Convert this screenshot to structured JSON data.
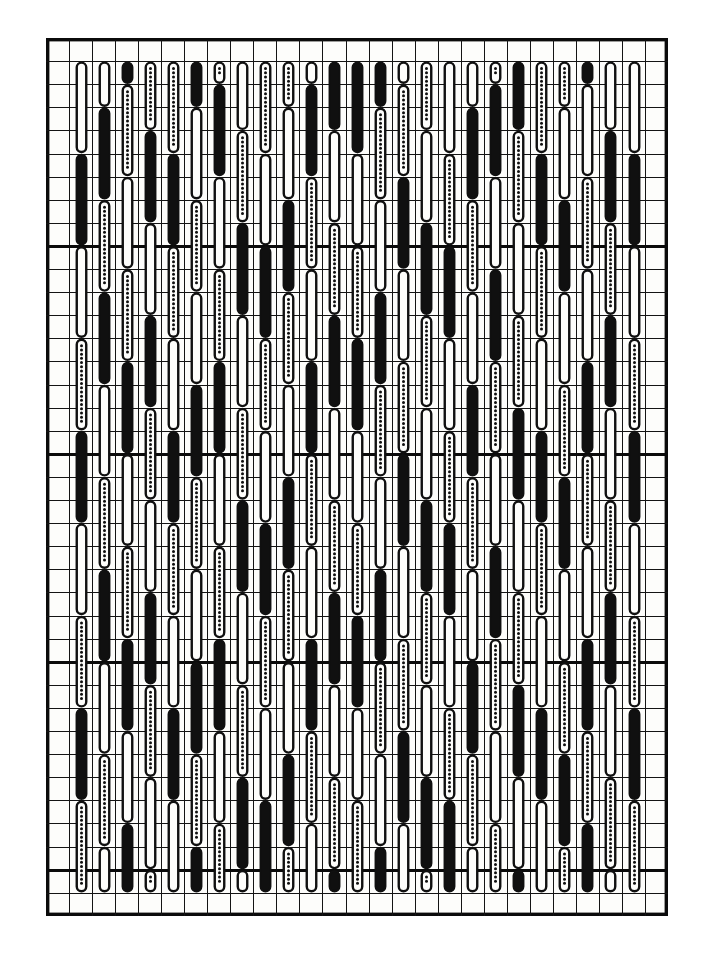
{
  "page": {
    "width": 704,
    "height": 962,
    "background_color": "#ffffff",
    "title": "Stitch pattern grid diagram"
  },
  "figure": {
    "x": 46,
    "y": 38,
    "width": 622,
    "height": 878,
    "paper_color": "#fdfdfb",
    "ink_color": "#101010"
  },
  "grid": {
    "columns": 27,
    "rows": 38,
    "cell_width": 23.04,
    "cell_height": 23.1,
    "minor_line_color": "#141414",
    "minor_line_width": 1.6,
    "major_line_color": "#0b0b0b",
    "major_line_width": 3.2,
    "major_row_interval": 9,
    "major_column_interval": 27,
    "frame_line_width": 3.4,
    "frame_color": "#0b0b0b"
  },
  "legend": {
    "fill_styles": [
      "solid",
      "dotted",
      "hollow"
    ],
    "solid_label": "solid filled stitch",
    "dotted_label": "beaded / dotted stitch",
    "hollow_label": "open outline stitch",
    "motif_label": "vertical capsule stitch mark"
  },
  "motif": {
    "shape": "capsule",
    "span_rows": 4,
    "stroke_width": 2.4,
    "capsule_width": 9.5,
    "dot_radius": 1.5,
    "dot_spacing": 4.2,
    "margin_columns_left": 1,
    "margin_columns_right": 1,
    "margin_rows_top": 1,
    "margin_rows_bottom": 1
  },
  "chart_data": {
    "type": "heatmap",
    "title": "Stitch pattern grid diagram",
    "xlabel": "",
    "ylabel": "",
    "columns": 27,
    "rows": 38,
    "legend": [
      "solid",
      "dotted",
      "hollow"
    ],
    "column_patterns": [
      {
        "column": 1,
        "offset": 0,
        "fills": [
          "dotted",
          "hollow",
          "solid",
          "hollow",
          "dotted",
          "solid",
          "hollow",
          "dotted",
          "solid"
        ]
      },
      {
        "column": 2,
        "offset": 2,
        "fills": [
          "hollow",
          "solid",
          "dotted",
          "solid",
          "hollow",
          "dotted",
          "solid",
          "hollow",
          "dotted"
        ]
      },
      {
        "column": 3,
        "offset": 1,
        "fills": [
          "solid",
          "dotted",
          "hollow",
          "dotted",
          "solid",
          "hollow",
          "dotted",
          "solid",
          "hollow"
        ]
      },
      {
        "column": 4,
        "offset": 3,
        "fills": [
          "dotted",
          "solid",
          "hollow",
          "solid",
          "dotted",
          "hollow",
          "solid",
          "dotted",
          "hollow"
        ]
      },
      {
        "column": 5,
        "offset": 0,
        "fills": [
          "hollow",
          "dotted",
          "solid",
          "dotted",
          "hollow",
          "solid",
          "dotted",
          "hollow",
          "solid"
        ]
      },
      {
        "column": 6,
        "offset": 2,
        "fills": [
          "solid",
          "hollow",
          "dotted",
          "hollow",
          "solid",
          "dotted",
          "hollow",
          "solid",
          "dotted"
        ]
      },
      {
        "column": 7,
        "offset": 1,
        "fills": [
          "dotted",
          "solid",
          "hollow",
          "dotted",
          "solid",
          "hollow",
          "dotted",
          "solid",
          "hollow"
        ]
      },
      {
        "column": 8,
        "offset": 3,
        "fills": [
          "hollow",
          "dotted",
          "solid",
          "hollow",
          "dotted",
          "solid",
          "hollow",
          "dotted",
          "solid"
        ]
      },
      {
        "column": 9,
        "offset": 0,
        "fills": [
          "solid",
          "dotted",
          "hollow",
          "solid",
          "dotted",
          "hollow",
          "solid",
          "dotted",
          "hollow"
        ]
      },
      {
        "column": 10,
        "offset": 2,
        "fills": [
          "dotted",
          "hollow",
          "solid",
          "dotted",
          "hollow",
          "solid",
          "dotted",
          "hollow",
          "solid"
        ]
      },
      {
        "column": 11,
        "offset": 1,
        "fills": [
          "hollow",
          "solid",
          "dotted",
          "hollow",
          "solid",
          "dotted",
          "hollow",
          "solid",
          "dotted"
        ]
      },
      {
        "column": 12,
        "offset": 3,
        "fills": [
          "solid",
          "hollow",
          "dotted",
          "solid",
          "hollow",
          "dotted",
          "solid",
          "hollow",
          "dotted"
        ]
      },
      {
        "column": 13,
        "offset": 0,
        "fills": [
          "dotted",
          "solid",
          "hollow",
          "dotted",
          "solid",
          "hollow",
          "dotted",
          "solid",
          "hollow"
        ]
      },
      {
        "column": 14,
        "offset": 2,
        "fills": [
          "solid",
          "dotted",
          "hollow",
          "solid",
          "dotted",
          "hollow",
          "solid",
          "dotted",
          "hollow"
        ]
      },
      {
        "column": 15,
        "offset": 1,
        "fills": [
          "hollow",
          "dotted",
          "solid",
          "hollow",
          "dotted",
          "solid",
          "hollow",
          "dotted",
          "solid"
        ]
      },
      {
        "column": 16,
        "offset": 3,
        "fills": [
          "dotted",
          "hollow",
          "solid",
          "dotted",
          "hollow",
          "solid",
          "dotted",
          "hollow",
          "solid"
        ]
      },
      {
        "column": 17,
        "offset": 0,
        "fills": [
          "solid",
          "hollow",
          "dotted",
          "solid",
          "hollow",
          "dotted",
          "solid",
          "hollow",
          "dotted"
        ]
      },
      {
        "column": 18,
        "offset": 2,
        "fills": [
          "hollow",
          "solid",
          "dotted",
          "hollow",
          "solid",
          "dotted",
          "hollow",
          "solid",
          "dotted"
        ]
      },
      {
        "column": 19,
        "offset": 1,
        "fills": [
          "dotted",
          "solid",
          "hollow",
          "solid",
          "dotted",
          "hollow",
          "solid",
          "dotted",
          "hollow"
        ]
      },
      {
        "column": 20,
        "offset": 3,
        "fills": [
          "solid",
          "dotted",
          "hollow",
          "dotted",
          "solid",
          "hollow",
          "dotted",
          "solid",
          "hollow"
        ]
      },
      {
        "column": 21,
        "offset": 0,
        "fills": [
          "hollow",
          "dotted",
          "solid",
          "dotted",
          "hollow",
          "solid",
          "dotted",
          "hollow",
          "solid"
        ]
      },
      {
        "column": 22,
        "offset": 2,
        "fills": [
          "dotted",
          "hollow",
          "solid",
          "hollow",
          "dotted",
          "solid",
          "hollow",
          "dotted",
          "solid"
        ]
      },
      {
        "column": 23,
        "offset": 1,
        "fills": [
          "solid",
          "hollow",
          "dotted",
          "hollow",
          "solid",
          "dotted",
          "hollow",
          "solid",
          "dotted"
        ]
      },
      {
        "column": 24,
        "offset": 3,
        "fills": [
          "hollow",
          "solid",
          "dotted",
          "solid",
          "hollow",
          "dotted",
          "solid",
          "hollow",
          "dotted"
        ]
      },
      {
        "column": 25,
        "offset": 0,
        "fills": [
          "dotted",
          "hollow",
          "solid",
          "hollow",
          "dotted",
          "solid",
          "hollow",
          "dotted",
          "solid"
        ]
      }
    ]
  }
}
